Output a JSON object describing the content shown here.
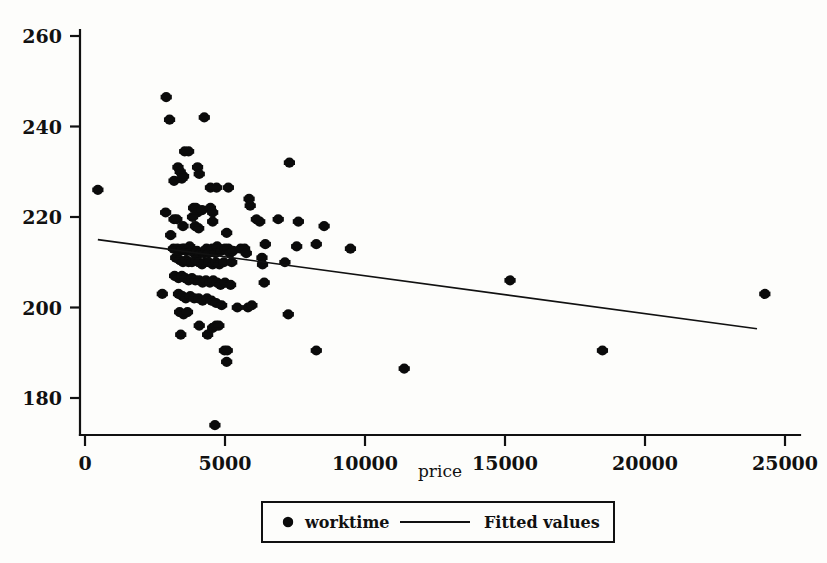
{
  "chart_data": {
    "type": "scatter",
    "title": "",
    "xlabel": "price",
    "ylabel": "",
    "xlim": [
      0,
      25000
    ],
    "ylim": [
      172,
      264
    ],
    "grid": false,
    "xticks": [
      0,
      5000,
      10000,
      15000,
      20000,
      25000
    ],
    "xtick_labels": [
      "0",
      "5000",
      "10000",
      "15000",
      "20000",
      "25000"
    ],
    "yticks": [
      180,
      200,
      220,
      240,
      260
    ],
    "ytick_labels": [
      "180",
      "200",
      "220",
      "240",
      "260"
    ],
    "legend_position": "below-center",
    "legend": [
      {
        "label": "worktime",
        "marker": "filled-circle"
      },
      {
        "label": "Fitted values",
        "marker": "line"
      }
    ],
    "series": [
      {
        "name": "worktime",
        "marker": "filled-circle",
        "color": "#0b0b0b",
        "points": [
          [
            460,
            226
          ],
          [
            2900,
            246.5
          ],
          [
            3020,
            241.5
          ],
          [
            4260,
            242
          ],
          [
            3560,
            234.5
          ],
          [
            3700,
            234.5
          ],
          [
            3320,
            231
          ],
          [
            3400,
            230
          ],
          [
            3180,
            228
          ],
          [
            3460,
            228.5
          ],
          [
            3520,
            229
          ],
          [
            4020,
            231
          ],
          [
            4080,
            229.5
          ],
          [
            7300,
            232
          ],
          [
            4480,
            226.5
          ],
          [
            4700,
            226.5
          ],
          [
            5120,
            226.5
          ],
          [
            5860,
            224
          ],
          [
            5900,
            222.5
          ],
          [
            2880,
            221
          ],
          [
            3180,
            219.5
          ],
          [
            3280,
            219.5
          ],
          [
            3880,
            222
          ],
          [
            3960,
            222
          ],
          [
            4020,
            221
          ],
          [
            3840,
            220
          ],
          [
            4180,
            221.5
          ],
          [
            4480,
            222
          ],
          [
            4560,
            221
          ],
          [
            4560,
            219
          ],
          [
            3940,
            218
          ],
          [
            4060,
            217.5
          ],
          [
            5060,
            216.5
          ],
          [
            3500,
            218
          ],
          [
            3060,
            216
          ],
          [
            6120,
            219.5
          ],
          [
            6240,
            219
          ],
          [
            6900,
            219.5
          ],
          [
            7620,
            219
          ],
          [
            8540,
            218
          ],
          [
            6440,
            214
          ],
          [
            7560,
            213.5
          ],
          [
            8260,
            214
          ],
          [
            9480,
            213
          ],
          [
            3160,
            213
          ],
          [
            3300,
            213
          ],
          [
            3400,
            212.5
          ],
          [
            3480,
            213
          ],
          [
            3560,
            213
          ],
          [
            3620,
            212.5
          ],
          [
            3740,
            213.5
          ],
          [
            3800,
            212.5
          ],
          [
            3900,
            212
          ],
          [
            4000,
            212.5
          ],
          [
            4120,
            212
          ],
          [
            4260,
            212
          ],
          [
            4340,
            213
          ],
          [
            4420,
            212
          ],
          [
            4540,
            213
          ],
          [
            4660,
            212
          ],
          [
            4720,
            213.5
          ],
          [
            4860,
            212.5
          ],
          [
            5000,
            213
          ],
          [
            5120,
            213
          ],
          [
            5180,
            212
          ],
          [
            5280,
            212.5
          ],
          [
            5560,
            213
          ],
          [
            5700,
            213
          ],
          [
            5760,
            212
          ],
          [
            3240,
            211
          ],
          [
            3380,
            210.5
          ],
          [
            3500,
            210
          ],
          [
            3620,
            210.5
          ],
          [
            3700,
            210
          ],
          [
            3820,
            210
          ],
          [
            3960,
            210.5
          ],
          [
            4060,
            210
          ],
          [
            4180,
            209.5
          ],
          [
            4300,
            210
          ],
          [
            4420,
            210
          ],
          [
            4560,
            209.5
          ],
          [
            4680,
            210
          ],
          [
            4800,
            209.5
          ],
          [
            4960,
            210
          ],
          [
            5240,
            210
          ],
          [
            6320,
            211
          ],
          [
            6340,
            209.5
          ],
          [
            7140,
            210
          ],
          [
            6400,
            205.5
          ],
          [
            3200,
            207
          ],
          [
            3340,
            206.5
          ],
          [
            3460,
            207
          ],
          [
            3580,
            206.5
          ],
          [
            3700,
            206
          ],
          [
            3820,
            206.5
          ],
          [
            3940,
            206
          ],
          [
            4080,
            206
          ],
          [
            4200,
            205.5
          ],
          [
            4320,
            206
          ],
          [
            4460,
            205.5
          ],
          [
            4580,
            206
          ],
          [
            4720,
            205.5
          ],
          [
            4840,
            205
          ],
          [
            5000,
            205.5
          ],
          [
            5200,
            205
          ],
          [
            2760,
            203
          ],
          [
            3340,
            203
          ],
          [
            3480,
            202.5
          ],
          [
            3600,
            202
          ],
          [
            3760,
            202.5
          ],
          [
            3900,
            202
          ],
          [
            4060,
            202
          ],
          [
            4200,
            201.5
          ],
          [
            4360,
            202
          ],
          [
            4520,
            201.5
          ],
          [
            4680,
            201
          ],
          [
            4880,
            200.5
          ],
          [
            5440,
            200
          ],
          [
            5820,
            200
          ],
          [
            5960,
            200.5
          ],
          [
            3380,
            199
          ],
          [
            3520,
            198.5
          ],
          [
            3660,
            199
          ],
          [
            7260,
            198.5
          ],
          [
            4080,
            196
          ],
          [
            4560,
            195.5
          ],
          [
            4680,
            196
          ],
          [
            4780,
            196
          ],
          [
            3420,
            194
          ],
          [
            4380,
            194
          ],
          [
            11400,
            186.5
          ],
          [
            4980,
            190.5
          ],
          [
            5080,
            190.5
          ],
          [
            8260,
            190.5
          ],
          [
            18480,
            190.5
          ],
          [
            5060,
            188
          ],
          [
            15180,
            206
          ],
          [
            24280,
            203
          ],
          [
            4640,
            174
          ]
        ]
      }
    ],
    "fit": {
      "name": "Fitted values",
      "x": [
        460,
        24000
      ],
      "y": [
        215.0,
        195.3
      ]
    }
  },
  "axes": {
    "x_axis_name": "x-axis",
    "y_axis_name": "y-axis"
  }
}
